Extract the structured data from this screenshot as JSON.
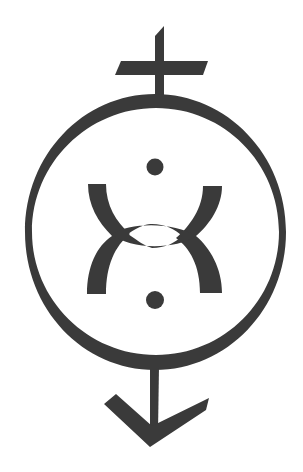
{
  "image": {
    "description": "Monochrome symbol: circular ring with a cross on top and a downward arrow below, enclosing two dots and an X-like figure formed by two curved arcs joined by a lens shape",
    "colors": {
      "ink": "#3a3a3a",
      "background": "#ffffff"
    },
    "components": [
      "cross",
      "ring",
      "upper-dot",
      "left-arc",
      "right-arc",
      "center-lens",
      "lower-dot",
      "arrow"
    ]
  }
}
